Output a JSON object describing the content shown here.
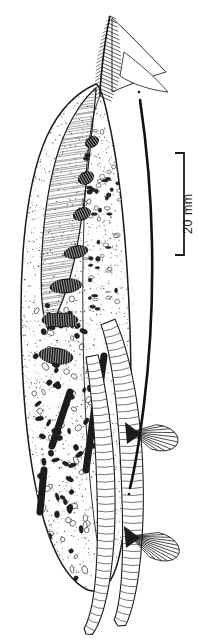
{
  "figure": {
    "background_color": "#ffffff",
    "ink_color": "#1a1a1a",
    "width": 198,
    "height": 639
  },
  "scale_bar": {
    "label": "20 mm",
    "value": 20,
    "unit": "mm",
    "orientation": "vertical",
    "label_rotation_deg": -90,
    "line_x": 184,
    "top_y": 153,
    "bottom_y": 255,
    "serif_length": 9,
    "color": "#1a1a1a"
  },
  "specimen": {
    "name": "arthropod-specimen",
    "body_outline": "M 96 84 C 78 92 60 108 47 136 C 36 160 28 196 24 240 C 20 286 20 340 24 396 C 28 452 36 500 49 536 C 60 566 74 584 88 590 C 100 594 110 586 116 568 C 124 544 128 500 130 448 C 132 392 131 330 127 268 C 123 206 116 152 108 118 C 104 98 100 86 96 84 Z",
    "inner_ridge": "M 100 96 C 92 112 87 148 85 196 C 82 258 82 330 85 402 C 88 468 93 522 100 556",
    "dorsal_flap": "M 96 88 C 84 98 70 118 60 146 C 50 176 44 214 42 252 C 40 288 42 316 48 330 C 56 318 66 296 74 262 C 82 224 88 172 92 130 C 94 110 96 96 96 88 Z",
    "segments_count": 7,
    "tubercle_count": 120,
    "stipple_density": "dense"
  },
  "appendages": {
    "plumose_seta_top": {
      "name": "plumose-seta",
      "description": "feathered bristle at anterior end",
      "barb_count": 22
    },
    "long_dark_seta": {
      "name": "long-curved-seta",
      "path": "M 140 100 C 146 140 151 190 152 244 C 153 300 150 356 144 404 C 139 444 134 472 130 488",
      "color": "#111111",
      "width": 2.6
    },
    "comb_appendage_upper": {
      "name": "comb-appendage-upper",
      "ray_count": 11,
      "origin_x": 131,
      "origin_y": 432
    },
    "comb_appendage_lower": {
      "name": "comb-appendage-lower",
      "ray_count": 13,
      "origin_x": 130,
      "origin_y": 536
    },
    "annulated_limb_a": {
      "name": "annulated-limb-a",
      "path": "M 108 322 C 120 352 128 400 131 452 C 134 506 133 552 129 584 C 126 606 122 620 118 626",
      "ring_count": 44
    },
    "annulated_limb_b": {
      "name": "annulated-limb-b",
      "path": "M 92 356 C 100 396 105 444 106 494 C 107 542 104 580 98 606 C 94 622 90 630 86 634",
      "ring_count": 38
    }
  }
}
